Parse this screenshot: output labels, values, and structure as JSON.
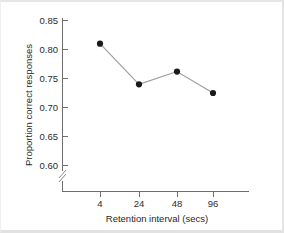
{
  "chart_data": {
    "type": "line",
    "title": "",
    "xlabel": "Retention interval (secs)",
    "ylabel": "Proportion correct responses",
    "categories": [
      "4",
      "24",
      "48",
      "96"
    ],
    "x": [
      4,
      24,
      48,
      96
    ],
    "values": [
      0.81,
      0.74,
      0.762,
      0.725
    ],
    "series": [
      {
        "name": "Proportion correct responses",
        "values": [
          0.81,
          0.74,
          0.762,
          0.725
        ]
      }
    ],
    "ylim": [
      0.595,
      0.85
    ],
    "y_ticks": [
      "0.85",
      "0.80",
      "0.75",
      "0.70",
      "0.65",
      "0.60"
    ],
    "y_tick_values": [
      0.85,
      0.8,
      0.75,
      0.7,
      0.65,
      0.6
    ],
    "x_ticks": [
      "4",
      "24",
      "48",
      "96"
    ],
    "grid": false,
    "legend": false,
    "y_axis_break": true,
    "marker": "filled-circle",
    "line_color": "#9a9a9a",
    "marker_color": "#1a1a1a",
    "axis_color": "#6e6e6e",
    "background_color": "#ffffff"
  },
  "axes": {
    "y_label": "Proportion correct responses",
    "x_label": "Retention interval (secs)",
    "y_tick_labels": [
      "0.85",
      "0.80",
      "0.75",
      "0.70",
      "0.65",
      "0.60"
    ],
    "x_tick_labels": [
      "4",
      "24",
      "48",
      "96"
    ]
  },
  "icons": {
    "axis_break": "axis-break-icon"
  }
}
